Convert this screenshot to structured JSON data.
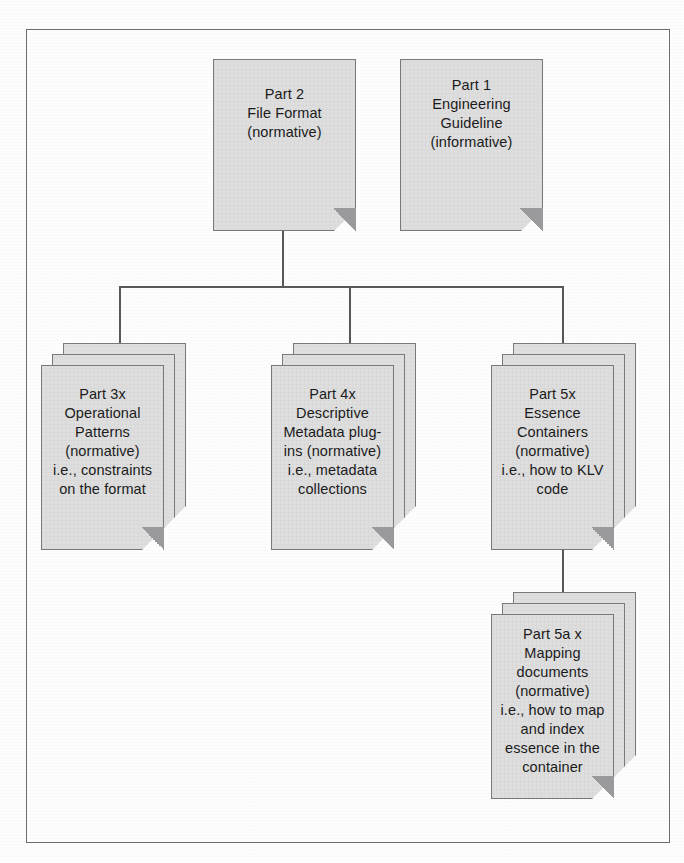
{
  "diagram": {
    "colors": {
      "paper_fill": "#dedede",
      "paper_border": "#7a7a7c",
      "connector": "#58585a",
      "frame_border": "#6e6e6e",
      "page_background": "#fefefe",
      "text": "#1b1b1b"
    },
    "nodes": [
      {
        "id": "part2",
        "label": "Part 2\nFile Format\n(normative)",
        "shape": "document",
        "stacked": false
      },
      {
        "id": "part1",
        "label": "Part 1\nEngineering\nGuideline\n(informative)",
        "shape": "document",
        "stacked": false
      },
      {
        "id": "part3x",
        "label": "Part 3x\nOperational\nPatterns\n(normative)\ni.e., constraints\non the format",
        "shape": "document",
        "stacked": true,
        "sheets": 3
      },
      {
        "id": "part4x",
        "label": "Part 4x\nDescriptive\nMetadata plug-\nins (normative)\ni.e., metadata\ncollections",
        "shape": "document",
        "stacked": true,
        "sheets": 3
      },
      {
        "id": "part5x",
        "label": "Part 5x\nEssence\nContainers\n(normative)\ni.e., how to KLV\ncode",
        "shape": "document",
        "stacked": true,
        "sheets": 3
      },
      {
        "id": "part5ax",
        "label": "Part 5a x\nMapping\ndocuments\n(normative)\ni.e., how to map\nand index\nessence in the\ncontainer",
        "shape": "document",
        "stacked": true,
        "sheets": 3
      }
    ],
    "edges": [
      {
        "from": "part2",
        "to": "bus",
        "style": "orthogonal"
      },
      {
        "from": "bus",
        "to": "part3x",
        "style": "orthogonal"
      },
      {
        "from": "bus",
        "to": "part4x",
        "style": "orthogonal"
      },
      {
        "from": "bus",
        "to": "part5x",
        "style": "orthogonal"
      },
      {
        "from": "part5x",
        "to": "part5ax",
        "style": "straight"
      }
    ]
  }
}
